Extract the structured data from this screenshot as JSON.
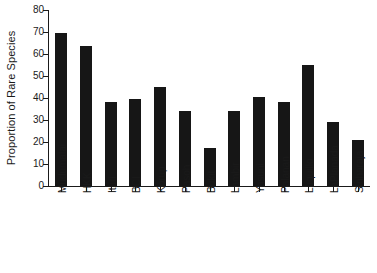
{
  "chart_data": {
    "type": "bar",
    "title": "",
    "xlabel": "",
    "ylabel": "Proportion of Rare Species",
    "ylim": [
      0,
      80
    ],
    "ytick_values": [
      0,
      10,
      20,
      30,
      40,
      50,
      60,
      70,
      80
    ],
    "ytick_labels": [
      "0",
      "10",
      "20",
      "30",
      "40",
      "50",
      "60",
      "70",
      "80"
    ],
    "grid": false,
    "legend": false,
    "bar_color": "#161616",
    "axis_color": "#1a1a1a",
    "categories": [
      "Mudumalai",
      "HKK",
      "Ituri",
      "BCI",
      "Korup",
      "Pasoh",
      "Bukit",
      "Lambir",
      "Yasuni",
      "Palanan",
      "Luquillo",
      "LaPlanada",
      "Sinharaja"
    ],
    "values": [
      69.5,
      63.5,
      38,
      39.5,
      45,
      34,
      17.5,
      34,
      40.5,
      38,
      55,
      29,
      21
    ]
  }
}
